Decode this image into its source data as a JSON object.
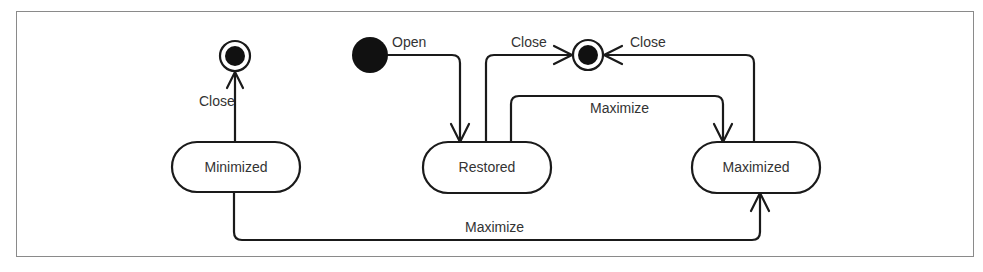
{
  "diagram": {
    "type": "uml-state-machine",
    "states": [
      {
        "id": "minimized",
        "label": "Minimized"
      },
      {
        "id": "restored",
        "label": "Restored"
      },
      {
        "id": "maximized",
        "label": "Maximized"
      }
    ],
    "pseudostates": [
      {
        "id": "initial",
        "kind": "initial"
      },
      {
        "id": "final-left",
        "kind": "final"
      },
      {
        "id": "final-center",
        "kind": "final"
      }
    ],
    "transitions": [
      {
        "from": "initial",
        "to": "restored",
        "label": "Open"
      },
      {
        "from": "minimized",
        "to": "final-left",
        "label": "Close"
      },
      {
        "from": "restored",
        "to": "final-center",
        "label": "Close"
      },
      {
        "from": "maximized",
        "to": "final-center",
        "label": "Close"
      },
      {
        "from": "restored",
        "to": "maximized",
        "label": "Maximize"
      },
      {
        "from": "minimized",
        "to": "maximized",
        "label": "Maximize"
      }
    ],
    "colors": {
      "stroke": "#1a1a1a",
      "text": "#333333",
      "frame": "#8a8a8a",
      "background": "#ffffff"
    }
  }
}
